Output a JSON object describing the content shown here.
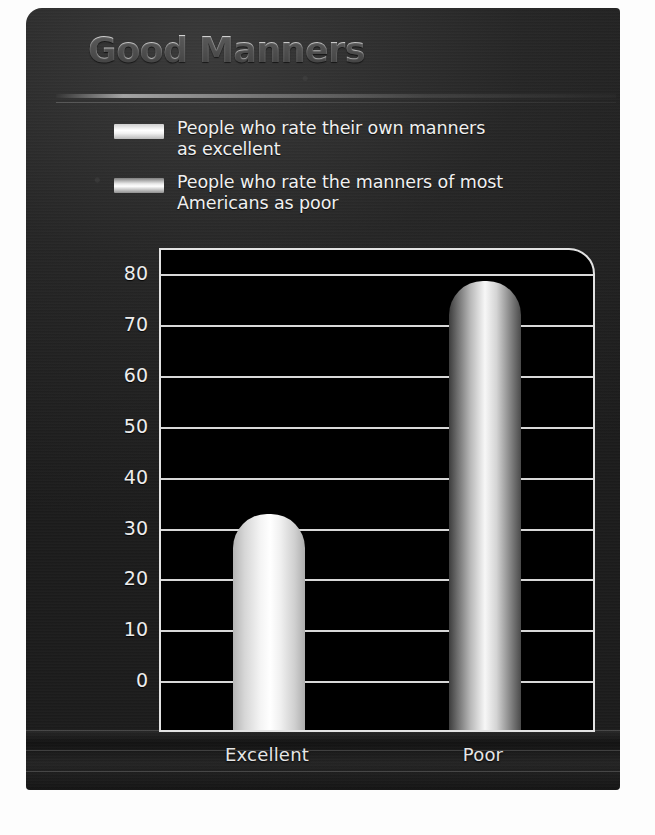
{
  "poster": {
    "title": "Good Manners",
    "background_color": "#202020",
    "accent_color": "#e2e2e2"
  },
  "legend": {
    "items": [
      {
        "swatch": "light-bar-swatch",
        "label_line1": "People who rate their own manners",
        "label_line2": "as excellent"
      },
      {
        "swatch": "gradient-bar-swatch",
        "label_line1": "People who rate the manners of most",
        "label_line2": "Americans as poor"
      }
    ]
  },
  "chart_data": {
    "type": "bar",
    "title": "Good Manners",
    "categories": [
      "Excellent",
      "Poor"
    ],
    "values": [
      33,
      79
    ],
    "series": [
      {
        "name": "People who rate their own manners as excellent",
        "values": [
          33,
          null
        ]
      },
      {
        "name": "People who rate the manners of most Americans as poor",
        "values": [
          null,
          79
        ]
      }
    ],
    "xlabel": "",
    "ylabel": "",
    "ylim": [
      0,
      85
    ],
    "yticks": [
      0,
      10,
      20,
      30,
      40,
      50,
      60,
      70,
      80
    ],
    "ytick_labels": [
      "0",
      "10",
      "20",
      "30",
      "40",
      "50",
      "60",
      "70",
      "80"
    ],
    "grid": true,
    "grid_axis": "y",
    "legend_position": "top",
    "bar_style": "rounded-top-cylinder",
    "plot_background": "#000000"
  }
}
